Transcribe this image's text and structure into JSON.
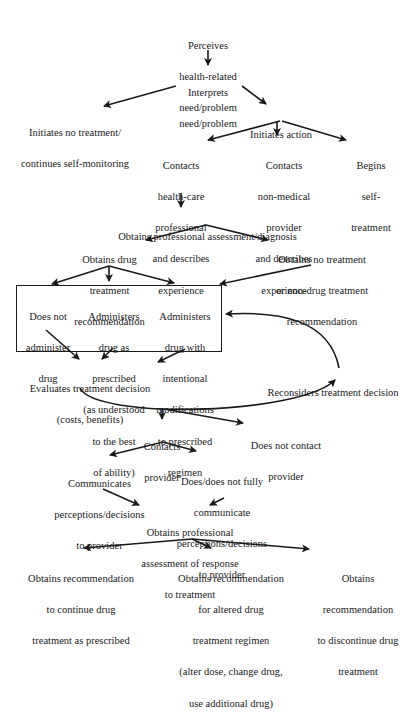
{
  "diagram": {
    "type": "flowchart",
    "nodes": {
      "perceives": [
        "Perceives",
        "health-related",
        "need/problem"
      ],
      "interprets": [
        "Interprets",
        "need/problem"
      ],
      "no_treatment": [
        "Initiates no treatment/",
        "continues self-monitoring"
      ],
      "initiates_action": [
        "Initiates action"
      ],
      "contacts_hcp": [
        "Contacts",
        "health-care",
        "professional",
        "and describes",
        "experience"
      ],
      "contacts_nonmedical": [
        "Contacts",
        "non-medical",
        "provider",
        "and describes",
        "experience"
      ],
      "self_treatment": [
        "Begins",
        "self-",
        "treatment"
      ],
      "assessment": [
        "Obtains professional assessment/diagnosis"
      ],
      "drug_rec": [
        "Obtains drug",
        "treatment",
        "recommendation"
      ],
      "no_drug_rec": [
        "Obtains no treatment",
        "or non-drug treatment",
        "recommendation"
      ],
      "not_administer": [
        "Does not",
        "administer",
        "drug"
      ],
      "as_prescribed": [
        "Administers",
        "drug as",
        "prescribed",
        "(as understood",
        "to the best",
        "of ability)"
      ],
      "modified": [
        "Administers",
        "drug with",
        "intentional",
        "modifications",
        "to prescribed",
        "regimen"
      ],
      "evaluates": [
        "Evaluates treatment decision",
        "(costs, benefits)"
      ],
      "reconsiders": [
        "Reconsiders treatment decision"
      ],
      "contacts_provider": [
        "Contacts",
        "provider"
      ],
      "not_contact": [
        "Does not contact",
        "provider"
      ],
      "communicates": [
        "Communicates",
        "perceptions/decisions",
        "to provider"
      ],
      "not_fully": [
        "Does/does not fully",
        "communicate",
        "perceptions/decisions",
        "to provider"
      ],
      "response_assessment": [
        "Obtains professional",
        "assessment of response",
        "to treatment"
      ],
      "continue": [
        "Obtains recommendation",
        "to continue drug",
        "treatment as prescribed"
      ],
      "altered": [
        "Obtains recommendation",
        "for altered drug",
        "treatment regimen",
        "(alter dose, change drug,",
        "use additional drug)"
      ],
      "discontinue": [
        "Obtains",
        "recommendation",
        "to discontinue drug",
        "treatment"
      ]
    },
    "edges": [
      [
        "perceives",
        "interprets"
      ],
      [
        "interprets",
        "no_treatment"
      ],
      [
        "interprets",
        "initiates_action"
      ],
      [
        "initiates_action",
        "contacts_hcp"
      ],
      [
        "initiates_action",
        "contacts_nonmedical"
      ],
      [
        "initiates_action",
        "self_treatment"
      ],
      [
        "contacts_hcp",
        "assessment"
      ],
      [
        "assessment",
        "drug_rec"
      ],
      [
        "assessment",
        "no_drug_rec"
      ],
      [
        "drug_rec",
        "not_administer"
      ],
      [
        "drug_rec",
        "as_prescribed"
      ],
      [
        "drug_rec",
        "modified"
      ],
      [
        "no_drug_rec",
        "administration_box"
      ],
      [
        "not_administer",
        "evaluates"
      ],
      [
        "as_prescribed",
        "evaluates"
      ],
      [
        "modified",
        "evaluates"
      ],
      [
        "evaluates",
        "reconsiders"
      ],
      [
        "reconsiders",
        "administration_box"
      ],
      [
        "evaluates",
        "contacts_provider"
      ],
      [
        "evaluates",
        "not_contact"
      ],
      [
        "contacts_provider",
        "communicates"
      ],
      [
        "contacts_provider",
        "not_fully"
      ],
      [
        "communicates",
        "response_assessment"
      ],
      [
        "not_fully",
        "response_assessment"
      ],
      [
        "response_assessment",
        "continue"
      ],
      [
        "response_assessment",
        "altered"
      ],
      [
        "response_assessment",
        "discontinue"
      ]
    ],
    "caption_partial": "(caption text cut off at bottom edge)"
  },
  "colors": {
    "ink": "#1a1a1a",
    "background": "#ffffff"
  }
}
